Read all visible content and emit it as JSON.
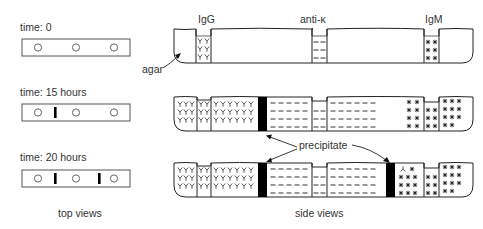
{
  "top_views": {
    "caption": "top views",
    "panels": [
      {
        "time_label": "time: 0",
        "wells": 3,
        "precipitate_bands": []
      },
      {
        "time_label": "time: 15 hours",
        "wells": 3,
        "precipitate_bands": [
          "between well 1 and well 2"
        ]
      },
      {
        "time_label": "time: 20 hours",
        "wells": 3,
        "precipitate_bands": [
          "between well 1 and well 2",
          "between well 2 and well 3"
        ]
      }
    ]
  },
  "side_views": {
    "caption": "side views",
    "well_labels": {
      "left": "IgG",
      "middle": "anti-κ",
      "right": "IgM"
    },
    "annotations": {
      "agar": "agar",
      "precipitate": "precipitate"
    },
    "symbols": {
      "IgG": "Y",
      "anti_kappa": "–",
      "IgM": "*"
    }
  },
  "colors": {
    "line": "#222222",
    "precipitate": "#000000",
    "text": "#333333",
    "background": "#ffffff"
  }
}
